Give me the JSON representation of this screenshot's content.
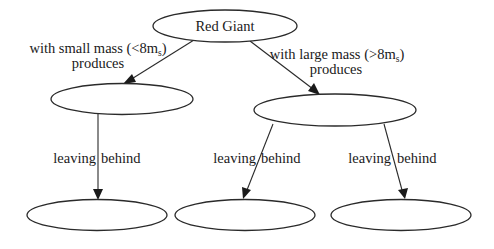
{
  "diagram": {
    "type": "flowchart-tree",
    "colors": {
      "background": "#ffffff",
      "stroke": "#2a2a2a",
      "text": "#1a1a1a"
    },
    "nodes": [
      {
        "id": "red-giant",
        "label": "Red Giant"
      },
      {
        "id": "small-mass-product",
        "label": ""
      },
      {
        "id": "large-mass-product",
        "label": ""
      },
      {
        "id": "small-mass-remnant",
        "label": ""
      },
      {
        "id": "large-mass-remnant-1",
        "label": ""
      },
      {
        "id": "large-mass-remnant-2",
        "label": ""
      }
    ],
    "edges": [
      {
        "from": "red-giant",
        "to": "small-mass-product",
        "label_line1_main": "with small mass (<8m",
        "label_line1_sub": "s",
        "label_line1_end": ")",
        "label_line2": "produces"
      },
      {
        "from": "red-giant",
        "to": "large-mass-product",
        "label_line1_main": "with large mass (>8m",
        "label_line1_sub": "s",
        "label_line1_end": ")",
        "label_line2": "produces"
      },
      {
        "from": "small-mass-product",
        "to": "small-mass-remnant",
        "label_left": "leaving",
        "label_right": "behind"
      },
      {
        "from": "large-mass-product",
        "to": "large-mass-remnant-1",
        "label_left": "leaving",
        "label_right": "behind"
      },
      {
        "from": "large-mass-product",
        "to": "large-mass-remnant-2",
        "label_left": "leaving",
        "label_right": "behind"
      }
    ]
  }
}
